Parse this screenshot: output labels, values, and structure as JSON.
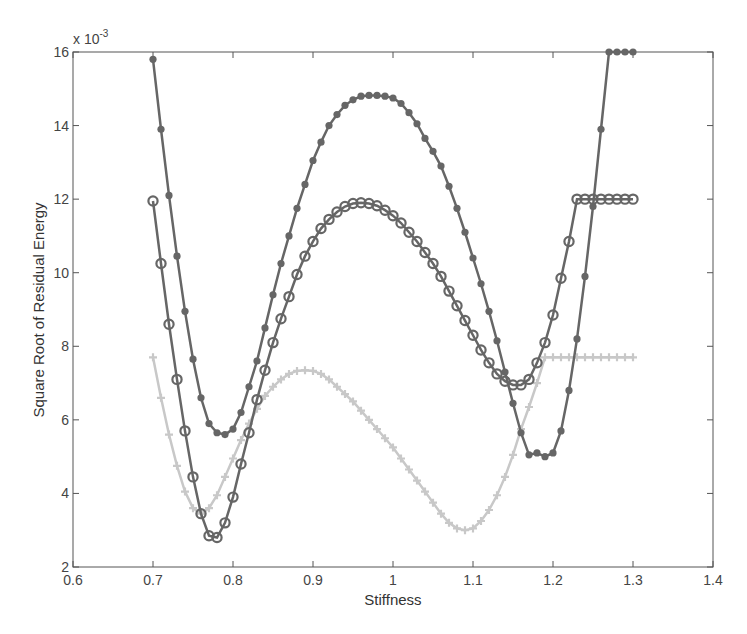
{
  "chart_data": {
    "type": "line",
    "title": "",
    "xlabel": "Stiffness",
    "ylabel": "Square Root of Residual Energy",
    "y_exponent_label": "x 10",
    "y_exponent_power": "-3",
    "xlim": [
      0.6,
      1.4
    ],
    "ylim": [
      2,
      16
    ],
    "x_ticks": [
      "0.6",
      "0.7",
      "0.8",
      "0.9",
      "1",
      "1.1",
      "1.2",
      "1.3",
      "1.4"
    ],
    "y_ticks": [
      "2",
      "4",
      "6",
      "8",
      "10",
      "12",
      "14",
      "16"
    ],
    "grid": false,
    "legend": "none",
    "x": [
      0.7,
      0.71,
      0.72,
      0.73,
      0.74,
      0.75,
      0.76,
      0.77,
      0.78,
      0.79,
      0.8,
      0.81,
      0.82,
      0.83,
      0.84,
      0.85,
      0.86,
      0.87,
      0.88,
      0.89,
      0.9,
      0.91,
      0.92,
      0.93,
      0.94,
      0.95,
      0.96,
      0.97,
      0.98,
      0.99,
      1.0,
      1.01,
      1.02,
      1.03,
      1.04,
      1.05,
      1.06,
      1.07,
      1.08,
      1.09,
      1.1,
      1.11,
      1.12,
      1.13,
      1.14,
      1.15,
      1.16,
      1.17,
      1.18,
      1.19,
      1.2,
      1.21,
      1.22,
      1.23,
      1.24,
      1.25,
      1.26,
      1.27,
      1.28,
      1.29,
      1.3
    ],
    "series": [
      {
        "name": "filled-dot series",
        "marker": "filled-circle",
        "color": "#666666",
        "values": [
          15.8,
          13.9,
          12.1,
          10.45,
          8.95,
          7.65,
          6.6,
          5.9,
          5.65,
          5.6,
          5.75,
          6.2,
          6.9,
          7.6,
          8.5,
          9.4,
          10.25,
          11.0,
          11.75,
          12.4,
          13.05,
          13.55,
          14.0,
          14.3,
          14.55,
          14.7,
          14.8,
          14.82,
          14.82,
          14.8,
          14.75,
          14.6,
          14.35,
          14.05,
          13.65,
          13.3,
          12.9,
          12.35,
          11.75,
          11.1,
          10.4,
          9.7,
          8.95,
          8.15,
          7.3,
          6.45,
          5.65,
          5.05,
          5.1,
          5.0,
          5.1,
          5.7,
          6.8,
          8.2,
          9.9,
          11.8,
          13.9,
          16.0,
          16.0,
          16.0,
          16.0
        ]
      },
      {
        "name": "open-circle series",
        "marker": "open-circle",
        "color": "#666666",
        "values": [
          11.95,
          10.25,
          8.6,
          7.1,
          5.7,
          4.45,
          3.45,
          2.85,
          2.8,
          3.2,
          3.9,
          4.8,
          5.65,
          6.55,
          7.35,
          8.1,
          8.75,
          9.35,
          9.95,
          10.45,
          10.85,
          11.2,
          11.45,
          11.65,
          11.8,
          11.88,
          11.9,
          11.88,
          11.82,
          11.7,
          11.55,
          11.35,
          11.1,
          10.85,
          10.55,
          10.25,
          9.9,
          9.5,
          9.1,
          8.7,
          8.3,
          7.9,
          7.55,
          7.25,
          7.05,
          6.95,
          6.95,
          7.1,
          7.55,
          8.1,
          8.85,
          9.85,
          10.85,
          12.0,
          12.0,
          12.0,
          12.0,
          12.0,
          12.0,
          12.0,
          12.0
        ]
      },
      {
        "name": "plus series",
        "marker": "plus",
        "color": "#c8c8c8",
        "values": [
          7.7,
          6.6,
          5.6,
          4.75,
          4.05,
          3.6,
          3.45,
          3.6,
          3.95,
          4.45,
          4.95,
          5.45,
          5.9,
          6.3,
          6.65,
          6.9,
          7.1,
          7.25,
          7.33,
          7.35,
          7.33,
          7.25,
          7.1,
          6.9,
          6.7,
          6.5,
          6.25,
          6.0,
          5.75,
          5.5,
          5.25,
          4.95,
          4.65,
          4.35,
          4.05,
          3.75,
          3.45,
          3.2,
          3.05,
          3.0,
          3.05,
          3.25,
          3.55,
          3.95,
          4.45,
          5.05,
          5.75,
          6.35,
          7.0,
          7.7,
          7.7,
          7.7,
          7.7,
          7.7,
          7.7,
          7.7,
          7.7,
          7.7,
          7.7,
          7.7,
          7.7
        ]
      }
    ]
  }
}
